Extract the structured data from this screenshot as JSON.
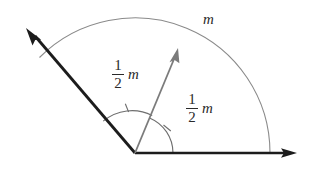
{
  "figure": {
    "background_color": "#ffffff",
    "labels": {
      "outer_arc": "m",
      "left_half": {
        "numerator": "1",
        "denominator": "2",
        "variable": "m"
      },
      "right_half": {
        "numerator": "1",
        "denominator": "2",
        "variable": "m"
      }
    },
    "colors": {
      "ray_black": "#1c1c1c",
      "bisector_gray": "#7b7b7b",
      "arc_gray": "#8a8a8a",
      "tick_gray": "#6e6e6e",
      "text": "#2a2a2a"
    },
    "geometry": {
      "vertex_x": 135,
      "vertex_y": 153,
      "horizontal_ray_tip_x": 297,
      "horizontal_ray_tip_y": 153,
      "upper_ray_tip_x": 26,
      "upper_ray_tip_y": 28,
      "bisector_tip_x": 178,
      "bisector_tip_y": 48,
      "outer_arc_radius": 135,
      "inner_arc_radius_left": 45,
      "inner_arc_radius_right": 38,
      "angle_total_degrees": 135,
      "angle_half_degrees": 67.5
    }
  }
}
